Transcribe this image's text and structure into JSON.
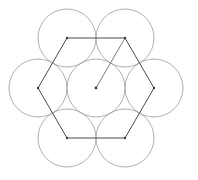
{
  "figure": {
    "canvas": {
      "width": 198,
      "height": 180,
      "background": "#ffffff"
    },
    "style": {
      "circle_stroke": "#9a9a9a",
      "circle_stroke_width": 0.8,
      "circle_fill": "none",
      "hexagon_stroke": "#4a4a4a",
      "hexagon_stroke_width": 1.0,
      "radius_stroke": "#6a6a6a",
      "radius_stroke_width": 0.9,
      "vertex_dot_fill": "#3a3a3a",
      "vertex_dot_radius": 1.2
    },
    "geometry": {
      "center": {
        "x": 96,
        "y": 88
      },
      "circle_radius": 29,
      "hexagon_circumradius": 58,
      "hexagon_orientation": "flat-left-right-vertices",
      "circle_count": 7,
      "hexagon_vertex_count": 6
    },
    "circles": [
      {
        "name": "center-circle",
        "cx": 96,
        "cy": 88,
        "r": 29
      },
      {
        "name": "top-left-circle",
        "cx": 67,
        "cy": 38,
        "r": 29
      },
      {
        "name": "top-right-circle",
        "cx": 125,
        "cy": 38,
        "r": 29
      },
      {
        "name": "right-circle",
        "cx": 154,
        "cy": 88,
        "r": 29
      },
      {
        "name": "bottom-right-circle",
        "cx": 125,
        "cy": 138,
        "r": 29
      },
      {
        "name": "bottom-left-circle",
        "cx": 67,
        "cy": 138,
        "r": 29
      },
      {
        "name": "left-circle",
        "cx": 38,
        "cy": 88,
        "r": 29
      }
    ],
    "hexagon": {
      "points": "67,38 125,38 154,88 125,138 67,138 38,88",
      "vertices": [
        {
          "name": "hexagon-vertex-top-left",
          "x": 67,
          "y": 38
        },
        {
          "name": "hexagon-vertex-top-right",
          "x": 125,
          "y": 38
        },
        {
          "name": "hexagon-vertex-right",
          "x": 154,
          "y": 88
        },
        {
          "name": "hexagon-vertex-bottom-right",
          "x": 125,
          "y": 138
        },
        {
          "name": "hexagon-vertex-bottom-left",
          "x": 67,
          "y": 138
        },
        {
          "name": "hexagon-vertex-left",
          "x": 38,
          "y": 88
        }
      ]
    },
    "radius_segment": {
      "name": "center-to-top-right-radius",
      "x1": 96,
      "y1": 88,
      "x2": 125,
      "y2": 38
    },
    "center_dot": {
      "cx": 96,
      "cy": 88,
      "r": 1.4
    }
  }
}
